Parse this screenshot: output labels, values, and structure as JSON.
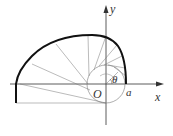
{
  "diagram": {
    "labels": {
      "y_axis": "y",
      "x_axis": "x",
      "origin": "O",
      "a": "a",
      "theta": "θ"
    },
    "colors": {
      "curve": "#111111",
      "rays": "#666666",
      "axes": "#333333",
      "circle": "#777777"
    }
  }
}
